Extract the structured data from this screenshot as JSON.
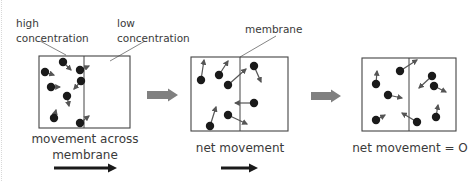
{
  "labels": {
    "high_line1": "high",
    "high_line2": "concentration",
    "low_line1": "low",
    "low_line2": "concentration",
    "membrane": "membrane",
    "caption1_line1": "movement across",
    "caption1_line2": "membrane",
    "caption2": "net movement",
    "caption3": "net movement = O"
  },
  "colors": {
    "particle": "#1a1a1a",
    "vector": "#555555",
    "box_border": "#444444",
    "step_arrow": "#808080",
    "direction_arrow": "#1a1a1a"
  },
  "panels": [
    {
      "name": "initial",
      "box": {
        "x": 39,
        "y": 56,
        "w": 91,
        "h": 72,
        "divider_x": 84
      },
      "particles": [
        {
          "x": 63,
          "y": 62,
          "dx": 8,
          "dy": 8
        },
        {
          "x": 45,
          "y": 72,
          "dx": 9,
          "dy": 3
        },
        {
          "x": 80,
          "y": 70,
          "dx": 9,
          "dy": -4
        },
        {
          "x": 81,
          "y": 81,
          "dx": -7,
          "dy": 8
        },
        {
          "x": 51,
          "y": 87,
          "dx": 9,
          "dy": 0
        },
        {
          "x": 67,
          "y": 96,
          "dx": 2,
          "dy": 10
        },
        {
          "x": 54,
          "y": 118,
          "dx": 2,
          "dy": -8
        },
        {
          "x": 80,
          "y": 123,
          "dx": 9,
          "dy": -7
        }
      ]
    },
    {
      "name": "diffusing",
      "box": {
        "x": 191,
        "y": 57,
        "w": 97,
        "h": 74,
        "divider_x": 240
      },
      "particles": [
        {
          "x": 201,
          "y": 80,
          "dx": 3,
          "dy": -20
        },
        {
          "x": 219,
          "y": 75,
          "dx": 9,
          "dy": -14
        },
        {
          "x": 228,
          "y": 85,
          "dx": 18,
          "dy": -16
        },
        {
          "x": 254,
          "y": 66,
          "dx": 7,
          "dy": 16
        },
        {
          "x": 254,
          "y": 103,
          "dx": -19,
          "dy": 0
        },
        {
          "x": 228,
          "y": 115,
          "dx": 19,
          "dy": 9
        },
        {
          "x": 210,
          "y": 126,
          "dx": 6,
          "dy": -19
        }
      ]
    },
    {
      "name": "equilibrium",
      "box": {
        "x": 362,
        "y": 58,
        "w": 94,
        "h": 73,
        "divider_x": 409
      },
      "particles": [
        {
          "x": 376,
          "y": 84,
          "dx": 1,
          "dy": -13
        },
        {
          "x": 400,
          "y": 71,
          "dx": 17,
          "dy": -11
        },
        {
          "x": 388,
          "y": 95,
          "dx": 14,
          "dy": 3
        },
        {
          "x": 376,
          "y": 120,
          "dx": 9,
          "dy": -5
        },
        {
          "x": 432,
          "y": 76,
          "dx": -13,
          "dy": 12
        },
        {
          "x": 434,
          "y": 86,
          "dx": 12,
          "dy": 6
        },
        {
          "x": 417,
          "y": 122,
          "dx": -15,
          "dy": -9
        },
        {
          "x": 436,
          "y": 117,
          "dx": 2,
          "dy": -12
        }
      ]
    }
  ],
  "step_arrows": [
    {
      "x1": 147,
      "x2": 178,
      "y": 95
    },
    {
      "x1": 311,
      "x2": 341,
      "y": 96
    }
  ],
  "direction_arrows": [
    {
      "x1": 54,
      "x2": 117,
      "y": 168
    },
    {
      "x1": 221,
      "x2": 258,
      "y": 168
    }
  ]
}
